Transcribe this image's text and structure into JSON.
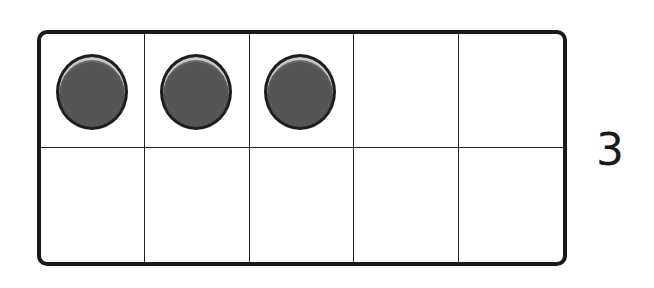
{
  "ten_frame": {
    "rows": 2,
    "columns": 5,
    "filled_cells": [
      {
        "row": 1,
        "col": 1,
        "filled": true
      },
      {
        "row": 1,
        "col": 2,
        "filled": true
      },
      {
        "row": 1,
        "col": 3,
        "filled": true
      },
      {
        "row": 1,
        "col": 4,
        "filled": false
      },
      {
        "row": 1,
        "col": 5,
        "filled": false
      },
      {
        "row": 2,
        "col": 1,
        "filled": false
      },
      {
        "row": 2,
        "col": 2,
        "filled": false
      },
      {
        "row": 2,
        "col": 3,
        "filled": false
      },
      {
        "row": 2,
        "col": 4,
        "filled": false
      },
      {
        "row": 2,
        "col": 5,
        "filled": false
      }
    ],
    "counter_color": "#555555",
    "border_color": "#1a1a1a"
  },
  "label": {
    "number": "3"
  }
}
